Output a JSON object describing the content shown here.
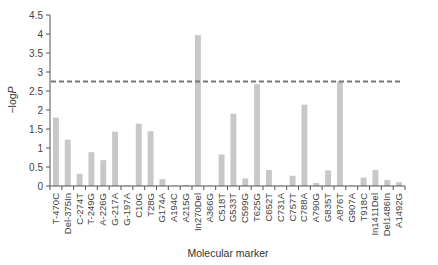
{
  "chart_data": {
    "type": "bar",
    "title": "",
    "xlabel": "Molecular marker",
    "ylabel": "−logP",
    "ylim": [
      0,
      4.5
    ],
    "yticks": [
      0,
      0.5,
      1,
      1.5,
      2,
      2.5,
      3,
      3.5,
      4,
      4.5
    ],
    "ytick_labels": [
      "0",
      "0.5",
      "1",
      "1.5",
      "2",
      "2.5",
      "3",
      "3.5",
      "4",
      "4.5"
    ],
    "grid": false,
    "legend": null,
    "threshold_line": {
      "value": 2.75,
      "style": "dashed",
      "color": "#777777"
    },
    "bar_color": "#c8c8c8",
    "categories": [
      "T-470C",
      "Del-375In",
      "C-274T",
      "T-249G",
      "A-226G",
      "G-217A",
      "G-197A",
      "C10G",
      "T28G",
      "G174A",
      "A194C",
      "A215G",
      "In270Del",
      "A366G",
      "C518T",
      "G533T",
      "C599G",
      "T625G",
      "C652T",
      "C731A",
      "C757T",
      "C788A",
      "A790G",
      "G835T",
      "A876T",
      "G907A",
      "T918C",
      "In1411Del",
      "Del1486In",
      "A1492G"
    ],
    "values": [
      1.8,
      1.22,
      0.32,
      0.89,
      0.68,
      1.43,
      0.02,
      1.64,
      1.44,
      0.18,
      0.01,
      0.03,
      3.97,
      0.01,
      0.83,
      1.9,
      0.2,
      2.68,
      0.42,
      0.01,
      0.27,
      2.14,
      0.08,
      0.41,
      2.75,
      0.0,
      0.22,
      0.42,
      0.16,
      0.1
    ]
  }
}
